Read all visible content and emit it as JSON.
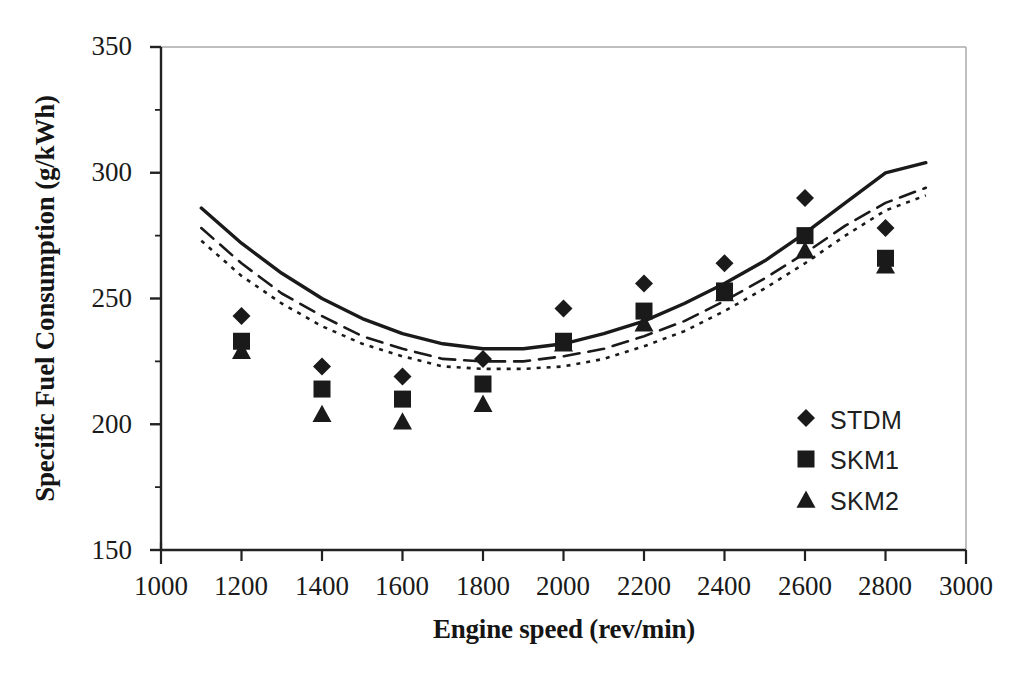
{
  "chart_data": {
    "type": "scatter",
    "title": "",
    "xlabel": "Engine speed (rev/min)",
    "ylabel": "Specific Fuel Consumption (g/kWh)",
    "xlim": [
      1000,
      3000
    ],
    "ylim": [
      150,
      350
    ],
    "xticks": [
      1000,
      1200,
      1400,
      1600,
      1800,
      2000,
      2200,
      2400,
      2600,
      2800,
      3000
    ],
    "yticks": [
      150,
      200,
      250,
      300,
      350
    ],
    "xtick_labels": [
      "1000",
      "1200",
      "1400",
      "1600",
      "1800",
      "2000",
      "2200",
      "2400",
      "2600",
      "2800",
      "3000"
    ],
    "ytick_labels": [
      "150",
      "200",
      "250",
      "300",
      "350"
    ],
    "x_minor_step": 200,
    "y_minor_step": 25,
    "grid": false,
    "legend_position": "inside-lower-right",
    "x": [
      1200,
      1400,
      1600,
      1800,
      2000,
      2200,
      2400,
      2600,
      2800
    ],
    "series": [
      {
        "name": "STDM",
        "marker": "diamond",
        "color": "#1a1a1a",
        "values": [
          243,
          223,
          219,
          226,
          246,
          256,
          264,
          290,
          278
        ],
        "trend": {
          "style": "solid",
          "x": [
            1100,
            1200,
            1300,
            1400,
            1500,
            1600,
            1700,
            1800,
            1900,
            2000,
            2100,
            2200,
            2300,
            2400,
            2500,
            2600,
            2700,
            2800,
            2900
          ],
          "y": [
            286,
            272,
            260,
            250,
            242,
            236,
            232,
            230,
            230,
            232,
            236,
            241,
            248,
            256,
            265,
            276,
            288,
            300,
            304
          ]
        }
      },
      {
        "name": "SKM1",
        "marker": "square",
        "color": "#1a1a1a",
        "values": [
          233,
          214,
          210,
          216,
          233,
          245,
          253,
          275,
          266
        ],
        "trend": {
          "style": "dashed",
          "x": [
            1100,
            1200,
            1300,
            1400,
            1500,
            1600,
            1700,
            1800,
            1900,
            2000,
            2100,
            2200,
            2300,
            2400,
            2500,
            2600,
            2700,
            2800,
            2900
          ],
          "y": [
            278,
            264,
            252,
            243,
            235,
            230,
            226,
            225,
            225,
            227,
            230,
            235,
            241,
            249,
            258,
            268,
            279,
            288,
            294
          ]
        }
      },
      {
        "name": "SKM2",
        "marker": "triangle",
        "color": "#1a1a1a",
        "values": [
          229,
          204,
          201,
          208,
          232,
          240,
          252,
          269,
          263
        ],
        "trend": {
          "style": "dotted",
          "x": [
            1100,
            1200,
            1300,
            1400,
            1500,
            1600,
            1700,
            1800,
            1900,
            2000,
            2100,
            2200,
            2300,
            2400,
            2500,
            2600,
            2700,
            2800,
            2900
          ],
          "y": [
            273,
            259,
            248,
            239,
            232,
            227,
            223,
            222,
            222,
            223,
            226,
            231,
            237,
            245,
            254,
            264,
            275,
            285,
            291
          ]
        }
      }
    ],
    "legend": [
      {
        "label": "STDM",
        "marker": "diamond"
      },
      {
        "label": "SKM1",
        "marker": "square"
      },
      {
        "label": "SKM2",
        "marker": "triangle"
      }
    ]
  }
}
